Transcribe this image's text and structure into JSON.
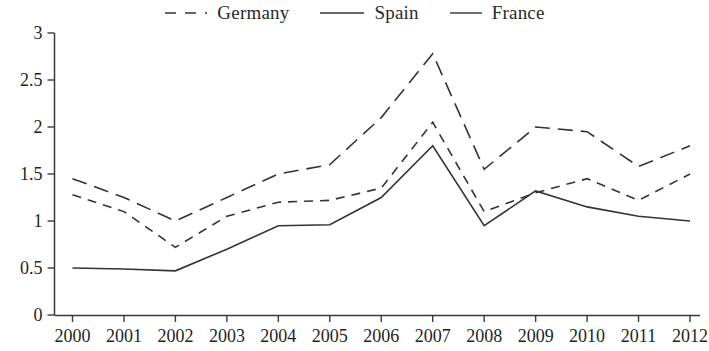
{
  "chart_data": {
    "type": "line",
    "title": "",
    "subtitle": "",
    "xlabel": "",
    "ylabel": "",
    "x": [
      2000,
      2001,
      2002,
      2003,
      2004,
      2005,
      2006,
      2007,
      2008,
      2009,
      2010,
      2011,
      2012
    ],
    "categories": [
      "2000",
      "2001",
      "2002",
      "2003",
      "2004",
      "2005",
      "2006",
      "2007",
      "2008",
      "2009",
      "2010",
      "2011",
      "2012"
    ],
    "series": [
      {
        "name": "Germany",
        "line_style": "dashed",
        "color": "#333333",
        "values": [
          1.28,
          1.1,
          0.72,
          1.05,
          1.2,
          1.22,
          1.35,
          2.05,
          1.1,
          1.3,
          1.45,
          1.22,
          1.5
        ]
      },
      {
        "name": "Spain",
        "line_style": "solid",
        "color": "#333333",
        "values": [
          0.5,
          0.49,
          0.47,
          0.7,
          0.95,
          0.96,
          1.25,
          1.8,
          0.95,
          1.32,
          1.15,
          1.05,
          1.0
        ]
      },
      {
        "name": "France",
        "line_style": "long-dashed",
        "color": "#333333",
        "values": [
          1.45,
          1.25,
          1.0,
          1.25,
          1.5,
          1.6,
          2.1,
          2.78,
          1.55,
          2.0,
          1.95,
          1.58,
          1.8
        ]
      }
    ],
    "ylim": [
      0,
      3
    ],
    "yticks": [
      0,
      0.5,
      1,
      1.5,
      2,
      2.5,
      3
    ],
    "ytick_labels": [
      "0",
      "0.5",
      "1",
      "1.5",
      "2",
      "2.5",
      "3"
    ],
    "xtick_labels": [
      "2000",
      "2001",
      "2002",
      "2003",
      "2004",
      "2005",
      "2006",
      "2007",
      "2008",
      "2009",
      "2010",
      "2011",
      "2012"
    ],
    "grid": false,
    "legend_position": "top-center",
    "legend_entries": [
      "Germany",
      "Spain",
      "France"
    ]
  },
  "legend": {
    "items": [
      {
        "label": "Germany",
        "style": "dashed"
      },
      {
        "label": "Spain",
        "style": "solid"
      },
      {
        "label": "France",
        "style": "solid"
      }
    ]
  },
  "axes": {
    "y_labels": [
      "3",
      "2.5",
      "2",
      "1.5",
      "1",
      "0.5",
      "0"
    ],
    "x_labels": [
      "2000",
      "2001",
      "2002",
      "2003",
      "2004",
      "2005",
      "2006",
      "2007",
      "2008",
      "2009",
      "2010",
      "2011",
      "2012"
    ]
  }
}
